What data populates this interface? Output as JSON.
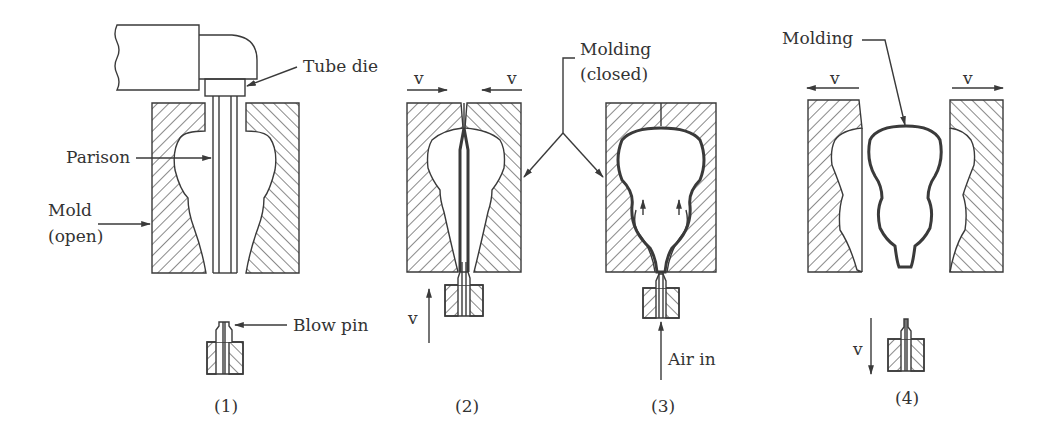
{
  "figure": {
    "steps": [
      {
        "id": "1",
        "caption": "(1)",
        "labels": {
          "tube_die": "Tube die",
          "parison": "Parison",
          "mold_line1": "Mold",
          "mold_line2": "(open)",
          "blow_pin": "Blow pin"
        }
      },
      {
        "id": "2",
        "caption": "(2)",
        "labels": {
          "v_left": "v",
          "v_right": "v",
          "v_up": "v"
        }
      },
      {
        "id": "3",
        "caption": "(3)",
        "labels": {
          "air_in": "Air in"
        }
      },
      {
        "id": "4",
        "caption": "(4)",
        "labels": {
          "molding": "Molding",
          "v_left": "v",
          "v_right": "v",
          "v_down": "v"
        }
      }
    ],
    "shared_labels": {
      "molding_closed_line1": "Molding",
      "molding_closed_line2": "(closed)"
    }
  }
}
